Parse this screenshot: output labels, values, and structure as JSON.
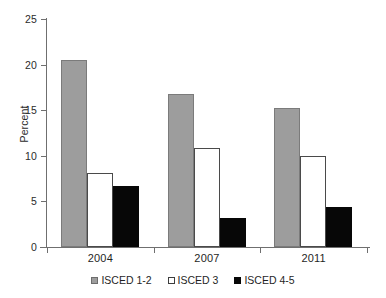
{
  "chart_data": {
    "type": "bar",
    "title": "",
    "xlabel": "",
    "ylabel": "Percent",
    "categories": [
      "2004",
      "2007",
      "2011"
    ],
    "series": [
      {
        "name": "ISCED 1-2",
        "color": "#9d9d9d",
        "values": [
          20.5,
          16.8,
          15.2
        ]
      },
      {
        "name": "ISCED 3",
        "color": "#ffffff",
        "values": [
          8.1,
          10.9,
          10.0
        ]
      },
      {
        "name": "ISCED 4-5",
        "color": "#070707",
        "values": [
          6.7,
          3.2,
          4.4
        ]
      }
    ],
    "ylim": [
      0,
      25
    ],
    "yticks": [
      "0",
      "5",
      "10",
      "15",
      "20",
      "25"
    ],
    "grid": false,
    "legend_position": "bottom"
  },
  "axis": {
    "y_title": "Percent",
    "y_ticks": [
      {
        "label": "25",
        "value": 25
      },
      {
        "label": "20",
        "value": 20
      },
      {
        "label": "15",
        "value": 15
      },
      {
        "label": "10",
        "value": 10
      },
      {
        "label": "5",
        "value": 5
      },
      {
        "label": "0",
        "value": 0
      }
    ]
  },
  "legend": {
    "items": [
      {
        "label": "ISCED 1-2",
        "swatch": "gray-swatch-icon"
      },
      {
        "label": "ISCED 3",
        "swatch": "white-swatch-icon"
      },
      {
        "label": "ISCED 4-5",
        "swatch": "black-swatch-icon"
      }
    ]
  }
}
